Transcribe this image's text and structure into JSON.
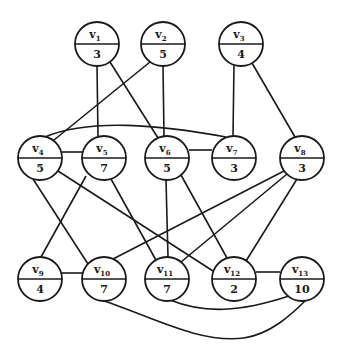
{
  "graph": {
    "nodes": [
      {
        "id": "v1",
        "name": "v",
        "sub": "1",
        "weight": "3",
        "x": 97,
        "y": 44
      },
      {
        "id": "v2",
        "name": "v",
        "sub": "2",
        "weight": "5",
        "x": 163,
        "y": 44
      },
      {
        "id": "v3",
        "name": "v",
        "sub": "3",
        "weight": "4",
        "x": 241,
        "y": 44
      },
      {
        "id": "v4",
        "name": "v",
        "sub": "4",
        "weight": "5",
        "x": 40,
        "y": 158
      },
      {
        "id": "v5",
        "name": "v",
        "sub": "5",
        "weight": "7",
        "x": 104,
        "y": 158
      },
      {
        "id": "v6",
        "name": "v",
        "sub": "6",
        "weight": "5",
        "x": 167,
        "y": 158
      },
      {
        "id": "v7",
        "name": "v",
        "sub": "7",
        "weight": "3",
        "x": 234,
        "y": 158
      },
      {
        "id": "v8",
        "name": "v",
        "sub": "8",
        "weight": "3",
        "x": 302,
        "y": 158
      },
      {
        "id": "v9",
        "name": "v",
        "sub": "9",
        "weight": "4",
        "x": 40,
        "y": 279
      },
      {
        "id": "v10",
        "name": "v",
        "sub": "10",
        "weight": "7",
        "x": 104,
        "y": 279
      },
      {
        "id": "v11",
        "name": "v",
        "sub": "11",
        "weight": "7",
        "x": 167,
        "y": 279
      },
      {
        "id": "v12",
        "name": "v",
        "sub": "12",
        "weight": "2",
        "x": 234,
        "y": 279
      },
      {
        "id": "v13",
        "name": "v",
        "sub": "13",
        "weight": "10",
        "x": 302,
        "y": 279
      }
    ],
    "edges": [
      {
        "from": "v1",
        "to": "v5",
        "d": "M97,66 L98,136"
      },
      {
        "from": "v1",
        "to": "v6",
        "d": "M110,62 L158,138"
      },
      {
        "from": "v2",
        "to": "v4",
        "d": "M150,62 L54,140"
      },
      {
        "from": "v2",
        "to": "v6",
        "d": "M163,66 L164,136"
      },
      {
        "from": "v3",
        "to": "v7",
        "d": "M234,64 L233,136"
      },
      {
        "from": "v3",
        "to": "v8",
        "d": "M252,63 L295,137"
      },
      {
        "from": "v4",
        "to": "v5",
        "d": "M62,152 L82,152"
      },
      {
        "from": "v4",
        "to": "v7",
        "d": "M45,137 C90,118 160,125 226,137"
      },
      {
        "from": "v6",
        "to": "v7",
        "d": "M189,150 L212,150"
      },
      {
        "from": "v4",
        "to": "v10",
        "d": "M33,179 L88,264"
      },
      {
        "from": "v4",
        "to": "v12",
        "d": "M58,171 L213,271"
      },
      {
        "from": "v5",
        "to": "v9",
        "d": "M86,176 L41,257"
      },
      {
        "from": "v5",
        "to": "v11",
        "d": "M111,179 L157,262"
      },
      {
        "from": "v6",
        "to": "v11",
        "d": "M166,180 L168,257"
      },
      {
        "from": "v6",
        "to": "v12",
        "d": "M181,175 L227,258"
      },
      {
        "from": "v8",
        "to": "v10",
        "d": "M284,171 L113,259"
      },
      {
        "from": "v8",
        "to": "v11",
        "d": "M287,174 L181,262"
      },
      {
        "from": "v8",
        "to": "v12",
        "d": "M297,179 L246,261"
      },
      {
        "from": "v9",
        "to": "v10",
        "d": "M62,273 L83,273"
      },
      {
        "from": "v12",
        "to": "v13",
        "d": "M256,272 L280,272"
      },
      {
        "from": "v11",
        "to": "v13",
        "d": "M170,300 C205,314 240,312 289,296"
      },
      {
        "from": "v10",
        "to": "v13",
        "d": "M104,301 C150,316 200,344 244,338 C270,334 290,316 306,300"
      }
    ]
  }
}
